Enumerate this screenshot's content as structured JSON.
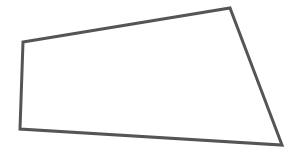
{
  "diagram": {
    "type": "quadrilateral",
    "background": "#ffffff",
    "stroke_color": "#555555",
    "fill_color": "#ffffff",
    "stroke_width": 3,
    "vertices": [
      {
        "x": 23,
        "y": 42
      },
      {
        "x": 230,
        "y": 8
      },
      {
        "x": 282,
        "y": 145
      },
      {
        "x": 20,
        "y": 129
      }
    ],
    "points": "23,42 230,8 282,145 20,129"
  }
}
